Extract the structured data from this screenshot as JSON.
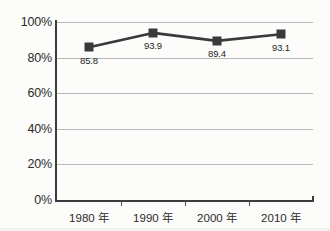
{
  "chart_data": {
    "type": "line",
    "title": "",
    "subtitle": "",
    "xlabel": "",
    "ylabel": "",
    "categories": [
      "1980 年",
      "1990 年",
      "2000 年",
      "2010 年"
    ],
    "values": [
      85.8,
      93.9,
      89.4,
      93.1
    ],
    "point_labels": [
      "85.8",
      "93.9",
      "89.4",
      "93.1"
    ],
    "series": [
      {
        "name": "",
        "values": [
          85.8,
          93.9,
          89.4,
          93.1
        ],
        "marker": "square",
        "color": "#3a3a3a"
      }
    ],
    "ylim": [
      0,
      100
    ],
    "yticks": [
      0,
      20,
      40,
      60,
      80,
      100
    ],
    "ytick_labels": [
      "0%",
      "20%",
      "40%",
      "60%",
      "80%",
      "100%"
    ],
    "grid": true,
    "grid_axis": "y",
    "legend": false,
    "legend_position": "none"
  },
  "colors": {
    "series": "#3a3a3a",
    "gridline": "#b9b9b9",
    "axis": "#3c3c3c",
    "background": "#fcfcfa",
    "text": "#2b2b2b"
  }
}
